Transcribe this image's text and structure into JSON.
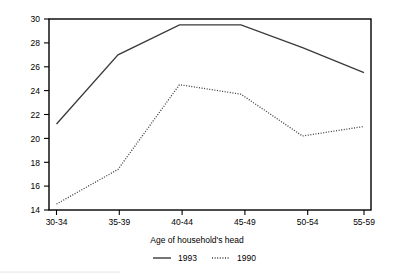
{
  "chart_data": {
    "type": "line",
    "title": "",
    "xlabel": "Age of household's head",
    "ylabel": "",
    "categories": [
      "30-34",
      "35-39",
      "40-44",
      "45-49",
      "50-54",
      "55-59"
    ],
    "series": [
      {
        "name": "1993",
        "style": "solid",
        "values": [
          21.2,
          27.0,
          29.5,
          29.5,
          27.6,
          25.5
        ]
      },
      {
        "name": "1990",
        "style": "dotted",
        "values": [
          14.5,
          17.4,
          24.5,
          23.7,
          20.2,
          21.0
        ]
      }
    ],
    "ylim": [
      14,
      30
    ],
    "yticks": [
      14,
      16,
      18,
      20,
      22,
      24,
      26,
      28,
      30
    ],
    "ytick_labels": [
      "14",
      "16",
      "18",
      "20",
      "22",
      "24",
      "26",
      "28",
      "30"
    ],
    "grid": false,
    "legend_position": "bottom",
    "line_color": "#3a3a3a",
    "axis_color": "#000000",
    "background": "#ffffff"
  },
  "axis": {
    "y_labels": [
      "30",
      "28",
      "26",
      "24",
      "22",
      "20",
      "18",
      "16",
      "14"
    ],
    "x_labels": [
      "30-34",
      "35-39",
      "40-44",
      "45-49",
      "50-54",
      "55-59"
    ],
    "x_title": "Age of household's head"
  },
  "legend": {
    "entries": [
      {
        "label": "1993",
        "style": "solid"
      },
      {
        "label": "1990",
        "style": "dotted"
      }
    ]
  }
}
